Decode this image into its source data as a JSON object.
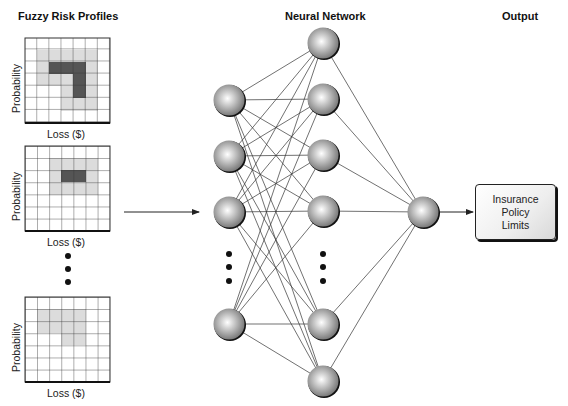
{
  "titles": {
    "profiles": "Fuzzy Risk Profiles",
    "network": "Neural Network",
    "output": "Output"
  },
  "profiles": [
    {
      "x_label": "Loss ($)",
      "y_label": "Probability",
      "shape": "L-shape"
    },
    {
      "x_label": "Loss ($)",
      "y_label": "Probability",
      "shape": "rectangle"
    },
    {
      "x_label": "Loss ($)",
      "y_label": "Probability",
      "shape": "L-shape-light"
    }
  ],
  "output_box": {
    "line1": "Insurance",
    "line2": "Policy",
    "line3": "Limits"
  },
  "colors": {
    "node_fill": "#9a9a9a",
    "dark_cell": "#555555",
    "light_cell": "#dcdcdc",
    "line": "#333333"
  }
}
